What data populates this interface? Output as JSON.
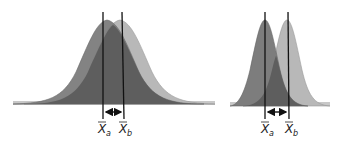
{
  "figure": {
    "colors": {
      "curve_a": "#7d7d7d",
      "curve_b": "#b8b8b8",
      "overlap": "#5e5e5e",
      "baseline_ends": "#c8c8c8",
      "lines": "#111111"
    },
    "panels": [
      {
        "name": "high-variability",
        "label_a": {
          "base": "X",
          "sub": "a"
        },
        "label_b": {
          "base": "X",
          "sub": "b"
        }
      },
      {
        "name": "low-variability",
        "label_a": {
          "base": "X",
          "sub": "a"
        },
        "label_b": {
          "base": "X",
          "sub": "b"
        }
      }
    ]
  }
}
